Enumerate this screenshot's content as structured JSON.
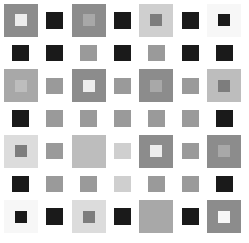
{
  "image": {
    "title": "Grayscale nested-square checkerboard pattern",
    "type": "abstract-pattern",
    "width": 249,
    "height": 243,
    "background": "#ffffff",
    "grid": {
      "columns": 7,
      "rows": 7
    }
  },
  "palette": {
    "white": "#ffffff",
    "near_white": "#f7f7f7",
    "very_light": "#ededed",
    "light": "#dcdcdc",
    "light_mid": "#cfcfcf",
    "mid_light": "#bdbdbd",
    "mid": "#a8a8a8",
    "mid_dark": "#9a9a9a",
    "dark_mid": "#8c8c8c",
    "dark": "#7d7d7d",
    "darker": "#707070",
    "black": "#1a1a1a"
  },
  "cells": [
    [
      {
        "kind": "big",
        "outer": "#8c8c8c",
        "inner": "#ededed"
      },
      {
        "kind": "empty"
      },
      {
        "kind": "big",
        "outer": "#8c8c8c",
        "inner": "#a8a8a8"
      },
      {
        "kind": "empty"
      },
      {
        "kind": "big",
        "outer": "#cfcfcf",
        "inner": "#7d7d7d"
      },
      {
        "kind": "empty"
      },
      {
        "kind": "big",
        "outer": "#f7f7f7",
        "inner": "#1a1a1a"
      }
    ],
    [
      {
        "kind": "empty"
      },
      {
        "kind": "conn",
        "chip": "#1a1a1a"
      },
      {
        "kind": "empty"
      },
      {
        "kind": "conn",
        "chip": "#1a1a1a"
      },
      {
        "kind": "empty"
      },
      {
        "kind": "conn",
        "chip": "#1a1a1a"
      },
      {
        "kind": "empty"
      }
    ],
    [
      {
        "kind": "big",
        "outer": "#a8a8a8",
        "inner": "#bdbdbd"
      },
      {
        "kind": "empty"
      },
      {
        "kind": "big",
        "outer": "#8c8c8c",
        "inner": "#ededed"
      },
      {
        "kind": "empty"
      },
      {
        "kind": "big",
        "outer": "#8c8c8c",
        "inner": "#a8a8a8"
      },
      {
        "kind": "empty"
      },
      {
        "kind": "big",
        "outer": "#bdbdbd",
        "inner": "#7d7d7d"
      }
    ],
    [
      {
        "kind": "empty"
      },
      {
        "kind": "conn",
        "chip": "#9a9a9a"
      },
      {
        "kind": "empty"
      },
      {
        "kind": "conn",
        "chip": "#9a9a9a"
      },
      {
        "kind": "empty"
      },
      {
        "kind": "conn",
        "chip": "#9a9a9a"
      },
      {
        "kind": "empty"
      }
    ],
    [
      {
        "kind": "big",
        "outer": "#dcdcdc",
        "inner": "#7d7d7d"
      },
      {
        "kind": "empty"
      },
      {
        "kind": "big",
        "outer": "#bdbdbd",
        "inner": "#bdbdbd"
      },
      {
        "kind": "empty"
      },
      {
        "kind": "big",
        "outer": "#8c8c8c",
        "inner": "#ededed"
      },
      {
        "kind": "empty"
      },
      {
        "kind": "big",
        "outer": "#8c8c8c",
        "inner": "#a8a8a8"
      }
    ],
    [
      {
        "kind": "empty"
      },
      {
        "kind": "conn",
        "chip": "#9a9a9a"
      },
      {
        "kind": "empty"
      },
      {
        "kind": "conn",
        "chip": "#cfcfcf"
      },
      {
        "kind": "empty"
      },
      {
        "kind": "conn",
        "chip": "#9a9a9a"
      },
      {
        "kind": "empty"
      }
    ],
    [
      {
        "kind": "big",
        "outer": "#f7f7f7",
        "inner": "#1a1a1a"
      },
      {
        "kind": "empty"
      },
      {
        "kind": "big",
        "outer": "#dcdcdc",
        "inner": "#7d7d7d"
      },
      {
        "kind": "empty"
      },
      {
        "kind": "big",
        "outer": "#a8a8a8",
        "inner": "#a8a8a8"
      },
      {
        "kind": "empty"
      },
      {
        "kind": "big",
        "outer": "#8c8c8c",
        "inner": "#f7f7f7"
      }
    ]
  ],
  "row_connectors": {
    "row1": [
      "#1a1a1a",
      "#1a1a1a",
      "#1a1a1a"
    ],
    "row3": [
      "#9a9a9a",
      "#9a9a9a",
      "#9a9a9a"
    ],
    "row5": [
      "#9a9a9a",
      "#cfcfcf",
      "#9a9a9a"
    ]
  },
  "col_connectors": {
    "after_row1": [
      "#1a1a1a",
      "#9a9a9a",
      "#9a9a9a",
      "#ededed",
      "#9a9a9a",
      "#9a9a9a",
      "#1a1a1a"
    ],
    "after_row3": [
      "#1a1a1a",
      "#dcdcdc",
      "#9a9a9a",
      "#8c8c8c",
      "#9a9a9a",
      "#ededed",
      "#1a1a1a"
    ],
    "after_row5": [
      "#1a1a1a",
      "#9a9a9a",
      "#9a9a9a",
      "#dcdcdc",
      "#9a9a9a",
      "#9a9a9a",
      "#1a1a1a"
    ]
  }
}
